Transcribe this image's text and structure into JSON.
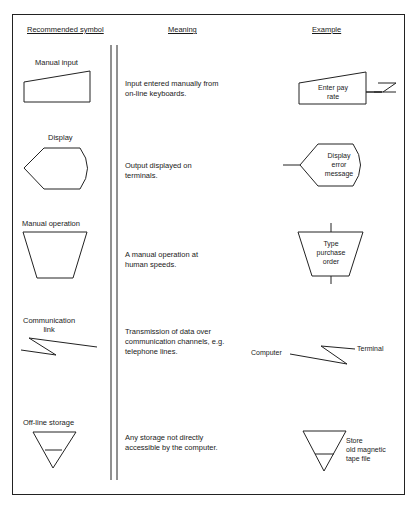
{
  "headers": {
    "symbol": "Recommended symbol",
    "meaning": "Meaning",
    "example": "Example"
  },
  "rows": [
    {
      "symbol_name": "Manual input",
      "meaning_lines": [
        "Input entered manually from",
        "on-line keyboards."
      ],
      "example_lines": [
        "Enter pay",
        "rate"
      ]
    },
    {
      "symbol_name": "Display",
      "meaning_lines": [
        "Output displayed on",
        "terminals."
      ],
      "example_lines": [
        "Display",
        "error",
        "message"
      ]
    },
    {
      "symbol_name": "Manual operation",
      "meaning_lines": [
        "A manual operation at",
        "human speeds."
      ],
      "example_lines": [
        "Type",
        "purchase",
        "order"
      ]
    },
    {
      "symbol_name_lines": [
        "Communication",
        "link"
      ],
      "meaning_lines": [
        "Transmission of data over",
        "communication channels, e.g.",
        "telephone lines."
      ],
      "example_labels": {
        "left": "Computer",
        "right": "Terminal"
      }
    },
    {
      "symbol_name": "Off-line storage",
      "meaning_lines": [
        "Any storage not directly",
        "accessible by the computer."
      ],
      "example_lines": [
        "Store",
        "old magnetic",
        "tape file"
      ]
    }
  ]
}
